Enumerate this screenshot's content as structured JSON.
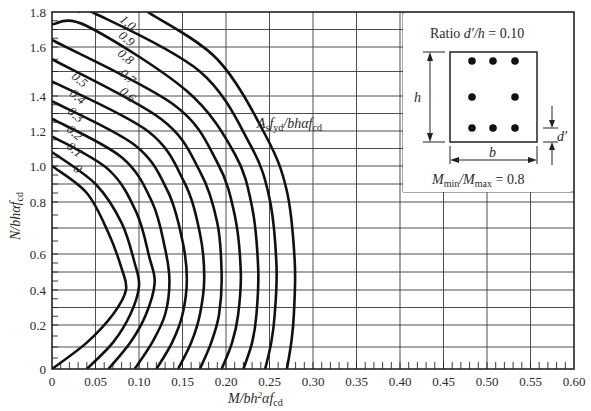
{
  "chart_data": {
    "type": "line",
    "title": "",
    "xlabel": "M/bh²αf_cd",
    "ylabel": "N/bhαf_cd",
    "xlim": [
      0,
      0.6
    ],
    "ylim": [
      0,
      1.8
    ],
    "grid": true,
    "x_ticks": [
      "0",
      "0.05",
      "0.10",
      "0.15",
      "0.20",
      "0.25",
      "0.30",
      "0.35",
      "0.40",
      "0.45",
      "0.50",
      "0.55",
      "0.60"
    ],
    "y_ticks": [
      "0",
      "0.2",
      "0.4",
      "0.6",
      "0.8",
      "1.0",
      "1.2",
      "1.4",
      "1.6",
      "1.8"
    ],
    "family_label": "A_s f_yd / bhαf_cd",
    "series": [
      {
        "name": "0",
        "points": [
          [
            0,
            0
          ],
          [
            0.04,
            0.12
          ],
          [
            0.07,
            0.26
          ],
          [
            0.085,
            0.4
          ],
          [
            0.08,
            0.52
          ],
          [
            0.065,
            0.68
          ],
          [
            0.04,
            0.85
          ],
          [
            0,
            1.0
          ]
        ]
      },
      {
        "name": "0.1",
        "points": [
          [
            0.04,
            0
          ],
          [
            0.07,
            0.12
          ],
          [
            0.09,
            0.26
          ],
          [
            0.1,
            0.42
          ],
          [
            0.095,
            0.55
          ],
          [
            0.08,
            0.72
          ],
          [
            0.05,
            0.9
          ],
          [
            0,
            1.08
          ]
        ]
      },
      {
        "name": "0.2",
        "points": [
          [
            0.065,
            0
          ],
          [
            0.09,
            0.12
          ],
          [
            0.108,
            0.26
          ],
          [
            0.118,
            0.44
          ],
          [
            0.112,
            0.58
          ],
          [
            0.097,
            0.76
          ],
          [
            0.065,
            0.98
          ],
          [
            0,
            1.17
          ]
        ]
      },
      {
        "name": "0.3",
        "points": [
          [
            0.095,
            0
          ],
          [
            0.115,
            0.12
          ],
          [
            0.13,
            0.26
          ],
          [
            0.135,
            0.45
          ],
          [
            0.13,
            0.62
          ],
          [
            0.115,
            0.8
          ],
          [
            0.08,
            1.05
          ],
          [
            0,
            1.27
          ]
        ]
      },
      {
        "name": "0.4",
        "points": [
          [
            0.12,
            0
          ],
          [
            0.138,
            0.12
          ],
          [
            0.15,
            0.26
          ],
          [
            0.155,
            0.46
          ],
          [
            0.15,
            0.65
          ],
          [
            0.133,
            0.86
          ],
          [
            0.095,
            1.12
          ],
          [
            0,
            1.37
          ]
        ]
      },
      {
        "name": "0.5",
        "points": [
          [
            0.145,
            0
          ],
          [
            0.16,
            0.12
          ],
          [
            0.17,
            0.26
          ],
          [
            0.175,
            0.47
          ],
          [
            0.17,
            0.68
          ],
          [
            0.152,
            0.91
          ],
          [
            0.11,
            1.2
          ],
          [
            0,
            1.46
          ]
        ]
      },
      {
        "name": "0.6",
        "points": [
          [
            0.17,
            0
          ],
          [
            0.183,
            0.12
          ],
          [
            0.192,
            0.26
          ],
          [
            0.195,
            0.48
          ],
          [
            0.19,
            0.72
          ],
          [
            0.17,
            0.97
          ],
          [
            0.125,
            1.27
          ],
          [
            0,
            1.55
          ]
        ]
      },
      {
        "name": "0.7",
        "points": [
          [
            0.195,
            0
          ],
          [
            0.207,
            0.12
          ],
          [
            0.214,
            0.26
          ],
          [
            0.217,
            0.5
          ],
          [
            0.21,
            0.75
          ],
          [
            0.19,
            1.02
          ],
          [
            0.14,
            1.35
          ],
          [
            0,
            1.64
          ]
        ]
      },
      {
        "name": "0.8",
        "points": [
          [
            0.22,
            0
          ],
          [
            0.23,
            0.12
          ],
          [
            0.235,
            0.26
          ],
          [
            0.237,
            0.52
          ],
          [
            0.23,
            0.78
          ],
          [
            0.21,
            1.07
          ],
          [
            0.155,
            1.42
          ],
          [
            0.04,
            1.72
          ],
          [
            0,
            1.73
          ]
        ]
      },
      {
        "name": "0.9",
        "points": [
          [
            0.245,
            0
          ],
          [
            0.252,
            0.12
          ],
          [
            0.256,
            0.26
          ],
          [
            0.258,
            0.54
          ],
          [
            0.25,
            0.82
          ],
          [
            0.228,
            1.12
          ],
          [
            0.17,
            1.5
          ],
          [
            0.05,
            1.79
          ],
          [
            0.03,
            1.8
          ]
        ]
      },
      {
        "name": "1.0",
        "points": [
          [
            0.27,
            0
          ],
          [
            0.275,
            0.12
          ],
          [
            0.278,
            0.26
          ],
          [
            0.279,
            0.56
          ],
          [
            0.27,
            0.86
          ],
          [
            0.246,
            1.17
          ],
          [
            0.19,
            1.55
          ],
          [
            0.11,
            1.8
          ]
        ]
      }
    ],
    "inset": {
      "ratio_label": "Ratio d′/h = 0.10",
      "h_label": "h",
      "b_label": "b",
      "d_label": "d′",
      "moment_label": "M_min/M_max = 0.8",
      "bars": 8
    }
  },
  "axes": {
    "x_title_main": "M/bh",
    "x_title_sup": "2",
    "x_title_tail": "αf",
    "x_title_sub": "cd",
    "y_title_main": "N/bhαf",
    "y_title_sub": "cd"
  },
  "annotations": {
    "family_main_a": "A",
    "family_sub_s": "s",
    "family_main_f": "f",
    "family_sub_yd": "yd",
    "family_main_rest": "/bhαf",
    "family_sub_cd": "cd",
    "inset_ratio_prefix": "Ratio ",
    "inset_ratio_var": "d′/h",
    "inset_ratio_value": " = 0.10",
    "inset_h": "h",
    "inset_b": "b",
    "inset_d": "d′",
    "inset_m": "M",
    "inset_min": "min",
    "inset_slash": "/M",
    "inset_max": "max",
    "inset_m_value": " = 0.8"
  },
  "colors": {
    "grid": "#3a3a3a",
    "curve": "#111111",
    "background": "#ffffff"
  }
}
